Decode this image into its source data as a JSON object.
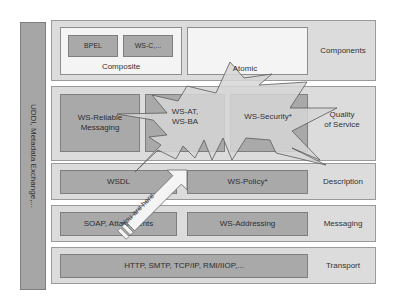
{
  "sidebar": {
    "label": "UDDI, Metadata Exchange,..."
  },
  "layers": {
    "components": {
      "label": "Components",
      "composite": {
        "label": "Composite",
        "items": [
          "BPEL",
          "WS-C,..."
        ]
      },
      "atomic": {
        "label": "Atomic"
      }
    },
    "qos": {
      "label": "Quality\nof Service",
      "label_line1": "Quality",
      "label_line2": "of Service",
      "items": [
        {
          "line1": "WS-Reliable",
          "line2": "Messaging"
        },
        {
          "line1": "WS-AT,",
          "line2": "WS-BA"
        },
        {
          "line1": "WS-Security*",
          "line2": ""
        }
      ]
    },
    "description": {
      "label": "Description",
      "items": [
        "WSDL",
        "WS-Policy*"
      ]
    },
    "messaging": {
      "label": "Messaging",
      "items": [
        "SOAP, Attachments",
        "WS-Addressing"
      ]
    },
    "transport": {
      "label": "Transport",
      "items": [
        "HTTP, SMTP, TCP/IP, RMI/IIOP,..."
      ]
    }
  },
  "annotations": {
    "you_are_here": "You are here"
  },
  "colors": {
    "layer_bg": "#dcdcdc",
    "box_dark": "#a9a9a9",
    "box_light": "#f4f4f4",
    "sidebar": "#a6a6a6",
    "starburst_fill": "#d4d4d4"
  }
}
